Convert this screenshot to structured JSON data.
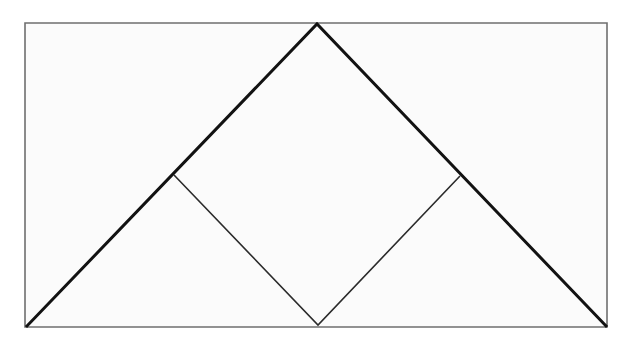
{
  "figure": {
    "canvas": {
      "width": 622,
      "height": 349,
      "background": "#ffffff"
    },
    "colors": {
      "page_background": "#ffffff",
      "plate_fill": "#fbfbfb",
      "plate_stroke": "#6f6f6f",
      "heavy_stroke": "#121212",
      "light_stroke": "#2b2b2b"
    },
    "stroke_widths": {
      "plate_border": 1.6,
      "triangle": 3.0,
      "square": 1.6
    },
    "shapes": [
      {
        "name": "outer-rectangle",
        "type": "rectangle",
        "stroke": "#6f6f6f",
        "fill": "#fbfbfb",
        "stroke_width": 1.6,
        "points": [
          [
            25,
            23
          ],
          [
            607,
            23
          ],
          [
            607,
            327
          ],
          [
            25,
            327
          ]
        ]
      },
      {
        "name": "large-triangle",
        "type": "polyline",
        "stroke": "#121212",
        "fill": "none",
        "stroke_width": 3.0,
        "points": [
          [
            27,
            326
          ],
          [
            317,
            24
          ],
          [
            606,
            326
          ]
        ]
      },
      {
        "name": "inner-square-lower-edges",
        "type": "polyline",
        "stroke": "#2b2b2b",
        "fill": "none",
        "stroke_width": 1.6,
        "points": [
          [
            174,
            175
          ],
          [
            318,
            325
          ],
          [
            460,
            176
          ]
        ]
      }
    ],
    "vertices": {
      "rect_top_left": [
        25,
        23
      ],
      "rect_top_right": [
        607,
        23
      ],
      "rect_bottom_right": [
        607,
        327
      ],
      "rect_bottom_left": [
        25,
        327
      ],
      "triangle_apex": [
        317,
        24
      ],
      "triangle_bottom_left": [
        27,
        326
      ],
      "triangle_bottom_right": [
        606,
        326
      ],
      "square_top": [
        317,
        24
      ],
      "square_right": [
        460,
        176
      ],
      "square_bottom": [
        318,
        325
      ],
      "square_left": [
        174,
        175
      ]
    }
  }
}
